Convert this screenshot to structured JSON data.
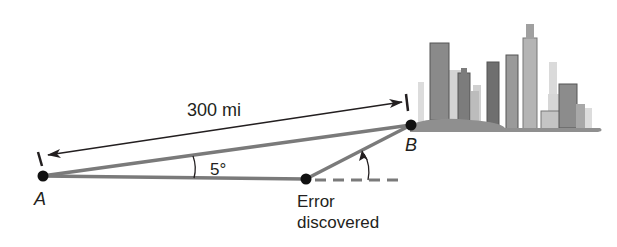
{
  "diagram": {
    "type": "navigation triangle",
    "points": {
      "A": {
        "label": "A",
        "x": 42,
        "y": 176
      },
      "B": {
        "label": "B",
        "x": 411,
        "y": 125
      },
      "E": {
        "label": "Error\ndiscovered",
        "x": 306,
        "y": 179
      }
    },
    "distance_label": "300 mi",
    "angle_label": "5°",
    "error_label_line1": "Error",
    "error_label_line2": "discovered",
    "colors": {
      "ink": "#231f20",
      "path": "#7a7a7a",
      "city_dark": "#6d6d6d",
      "city_mid": "#a8a8a8",
      "city_light": "#d4d4d4"
    }
  }
}
